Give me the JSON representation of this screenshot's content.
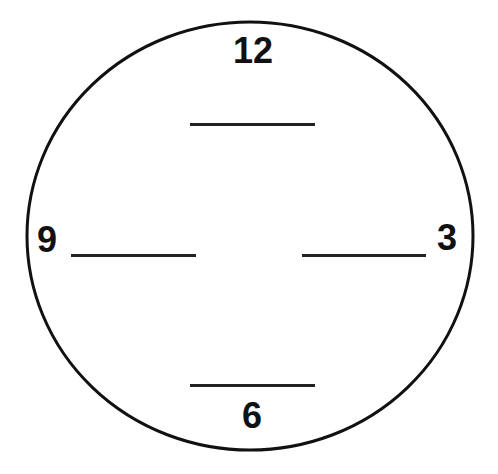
{
  "diagram": {
    "type": "clock-face-worksheet",
    "face": {
      "stroke": "#111111",
      "fill": "#ffffff"
    },
    "numbers": [
      {
        "label": "12",
        "position": "top"
      },
      {
        "label": "3",
        "position": "right"
      },
      {
        "label": "6",
        "position": "bottom"
      },
      {
        "label": "9",
        "position": "left"
      }
    ],
    "blanks": [
      {
        "position": "top",
        "value": ""
      },
      {
        "position": "right",
        "value": ""
      },
      {
        "position": "bottom",
        "value": ""
      },
      {
        "position": "left",
        "value": ""
      }
    ]
  }
}
